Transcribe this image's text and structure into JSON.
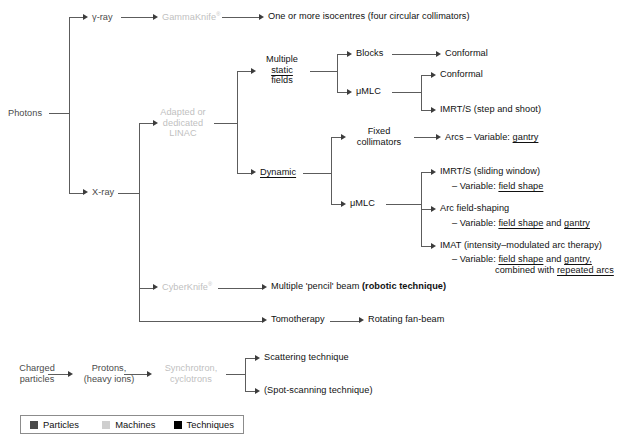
{
  "diagram": {
    "colors": {
      "particles": "#4a4a4a",
      "machines": "#bfbfbf",
      "techniques": "#111111",
      "connector": "#5c5c5c",
      "background": "#ffffff",
      "legend_border": "#8c8c8c"
    },
    "branches": {
      "photons": {
        "root_label": "Photons",
        "gamma_ray_label": "γ-ray",
        "xray_label": "X-ray",
        "gammaknife_label": "GammaKnife",
        "gammaknife_sup": "®",
        "gammaknife_result": "One or more isocentres (four circular collimators)",
        "linac_line1": "Adapted or",
        "linac_line2": "dedicated",
        "linac_line3": "LINAC",
        "cyberknife_label": "CyberKnife",
        "cyberknife_sup": "®",
        "cyberknife_result_plain": "Multiple 'pencil' beam ",
        "cyberknife_result_bold": "(robotic technique)",
        "tomotherapy_label": "Tomotherapy",
        "tomotherapy_result": "Rotating fan-beam"
      },
      "static_fields": {
        "line1": "Multiple",
        "line2_underlined": "static",
        "line3": "fields",
        "blocks_label": "Blocks",
        "blocks_result": "Conformal",
        "umlc_label": "μMLC",
        "umlc_result_1": "Conformal",
        "umlc_result_2": "IMRT/S (step and shoot)"
      },
      "dynamic": {
        "label_underlined": "Dynamic",
        "fixed_collimators_line1": "Fixed",
        "fixed_collimators_line2": "collimators",
        "fixed_collimators_result_pre": "Arcs – Variable: ",
        "fixed_collimators_result_var": "gantry",
        "umlc_label": "μMLC",
        "outputs": [
          {
            "title": "IMRT/S (sliding window)",
            "variable_pre": "– Variable: ",
            "variable_1": "field shape",
            "variable_mid": "",
            "variable_2": "",
            "extra_pre": "",
            "extra_var": "",
            "extra_post": ""
          },
          {
            "title": "Arc field-shaping",
            "variable_pre": "– Variable: ",
            "variable_1": "field shape",
            "variable_mid": " and ",
            "variable_2": "gantry",
            "extra_pre": "",
            "extra_var": "",
            "extra_post": ""
          },
          {
            "title": "IMAT (intensity–modulated arc therapy)",
            "variable_pre": "– Variable: ",
            "variable_1": "field shape",
            "variable_mid": " and ",
            "variable_2": "gantry,",
            "extra_pre": "combined with ",
            "extra_var": "repeated arcs",
            "extra_post": ""
          }
        ]
      },
      "charged_particles": {
        "root_line1": "Charged",
        "root_line2": "particles",
        "protons_line1": "Protons,",
        "protons_line2": "(heavy ions)",
        "accelerators_line1": "Synchrotron,",
        "accelerators_line2": "cyclotrons",
        "result_1": "Scattering technique",
        "result_2": "(Spot-scanning technique)"
      }
    },
    "legend": {
      "items": [
        {
          "label": "Particles",
          "color": "#4a4a4a"
        },
        {
          "label": "Machines",
          "color": "#cfcfcf"
        },
        {
          "label": "Techniques",
          "color": "#000000"
        }
      ]
    }
  }
}
